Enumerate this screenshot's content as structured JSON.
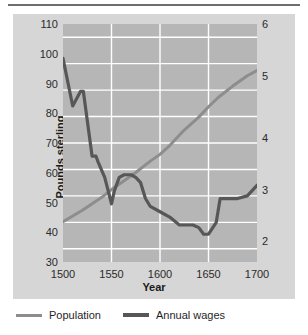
{
  "figure": {
    "has_top_rule": true,
    "has_bottom_rule": true,
    "panel_bg": "#d6d6d6",
    "plot_bg": "#b6b6b6",
    "gridline_color": "#ffffff"
  },
  "axes": {
    "left_title": "Pounds sterling",
    "right_title": "Population (in millions)",
    "x_title": "Year",
    "left_ticks": [
      "110",
      "100",
      "90",
      "80",
      "70",
      "60",
      "50",
      "40",
      "30"
    ],
    "right_ticks": [
      "6",
      "5",
      "4",
      "3",
      "2"
    ],
    "x_ticks": [
      "1500",
      "1550",
      "1600",
      "1650",
      "1700"
    ]
  },
  "legend": {
    "items": [
      {
        "label": "Population",
        "color": "#8d8d8d",
        "swatch": "line-swatch-population"
      },
      {
        "label": "Annual wages",
        "color": "#575757",
        "swatch": "line-swatch-annual-wages"
      }
    ]
  },
  "chart_data": {
    "type": "line",
    "title": "",
    "subtitle": "",
    "xlabel": "Year",
    "ylabel": "Pounds sterling",
    "y2label": "Population (in millions)",
    "xlim": [
      1500,
      1700
    ],
    "ylim": [
      25,
      115
    ],
    "y2lim": [
      1.6,
      6.2
    ],
    "xticks": [
      1500,
      1550,
      1600,
      1650,
      1700
    ],
    "yticks": [
      30,
      40,
      50,
      60,
      70,
      80,
      90,
      100,
      110
    ],
    "y2ticks": [
      2,
      3,
      4,
      5,
      6
    ],
    "grid": "both-axes-white-gridlines",
    "legend_position": "below-plot",
    "series": [
      {
        "name": "Annual wages",
        "axis": "left",
        "units": "pounds sterling",
        "color": "#575757",
        "x": [
          1500,
          1510,
          1518,
          1521,
          1530,
          1534,
          1536,
          1543,
          1550,
          1553,
          1558,
          1563,
          1570,
          1575,
          1580,
          1585,
          1590,
          1600,
          1610,
          1620,
          1628,
          1634,
          1640,
          1645,
          1650,
          1658,
          1662,
          1668,
          1680,
          1690,
          1695,
          1700
        ],
        "y": [
          102,
          84,
          89.5,
          89.5,
          65,
          65,
          63,
          57,
          47,
          52,
          57,
          58,
          58,
          57,
          55,
          49,
          46,
          44,
          42,
          39,
          39,
          39,
          38,
          35.5,
          35.5,
          40,
          49,
          49,
          49,
          50,
          52,
          54
        ]
      },
      {
        "name": "Population",
        "axis": "right",
        "units": "millions",
        "color": "#8d8d8d",
        "x": [
          1500,
          1520,
          1540,
          1550,
          1560,
          1575,
          1590,
          1600,
          1610,
          1625,
          1640,
          1650,
          1660,
          1675,
          1690,
          1700
        ],
        "y": [
          2.38,
          2.6,
          2.85,
          3.0,
          3.13,
          3.33,
          3.55,
          3.68,
          3.85,
          4.15,
          4.4,
          4.6,
          4.78,
          5.0,
          5.2,
          5.3
        ]
      }
    ]
  }
}
